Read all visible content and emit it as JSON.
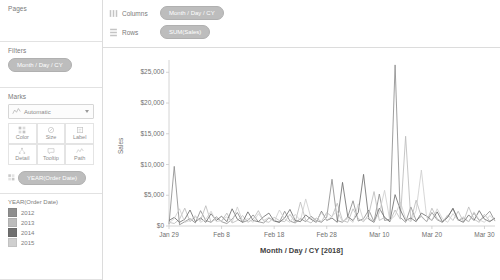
{
  "left_panel": {
    "pages": {
      "title": "Pages"
    },
    "filters": {
      "title": "Filters",
      "pills": [
        "Month / Day / CY"
      ]
    },
    "marks": {
      "title": "Marks",
      "mark_type": "Automatic",
      "buttons": [
        {
          "label": "Color",
          "icon": "color-icon"
        },
        {
          "label": "Size",
          "icon": "size-icon"
        },
        {
          "label": "Label",
          "icon": "label-icon"
        },
        {
          "label": "Detail",
          "icon": "detail-icon"
        },
        {
          "label": "Tooltip",
          "icon": "tooltip-icon"
        },
        {
          "label": "Path",
          "icon": "path-icon"
        }
      ],
      "encoding_pills": [
        {
          "label": "YEAR(Order Date)",
          "shelf": "Color"
        }
      ]
    },
    "legend": {
      "title": "YEAR(Order Date)",
      "items": [
        {
          "label": "2012",
          "color": "#8e8e8e"
        },
        {
          "label": "2013",
          "color": "#bcbcbc"
        },
        {
          "label": "2014",
          "color": "#6f6f6f"
        },
        {
          "label": "2015",
          "color": "#cfcfcf"
        }
      ]
    }
  },
  "shelves": {
    "columns": {
      "name": "Columns",
      "pills": [
        "Month / Day / CY"
      ]
    },
    "rows": {
      "name": "Rows",
      "pills": [
        "SUM(Sales)"
      ]
    }
  },
  "chart_data": {
    "type": "line",
    "title": "",
    "xlabel": "Month / Day / CY [2018]",
    "ylabel": "Sales",
    "ylim": [
      0,
      27000
    ],
    "ytick_labels": [
      "$0",
      "$5,000",
      "$10,000",
      "$15,000",
      "$20,000",
      "$25,000"
    ],
    "ytick_values": [
      0,
      5000,
      10000,
      15000,
      20000,
      25000
    ],
    "xtick_labels": [
      "Jan 29",
      "Feb 8",
      "Feb 18",
      "Feb 28",
      "Mar 10",
      "Mar 20",
      "Mar 30"
    ],
    "xtick_index": [
      0,
      10,
      20,
      30,
      40,
      50,
      60
    ],
    "x_count": 63,
    "grid": false,
    "legend_position": "left-panel",
    "series": [
      {
        "name": "2012",
        "color": "#8e8e8e",
        "values": [
          300,
          9700,
          200,
          700,
          1200,
          500,
          2500,
          900,
          600,
          1500,
          700,
          400,
          1100,
          2200,
          600,
          900,
          1800,
          700,
          500,
          1300,
          900,
          600,
          2400,
          800,
          500,
          1200,
          700,
          1600,
          900,
          600,
          1400,
          7600,
          900,
          600,
          1500,
          4100,
          800,
          1200,
          2600,
          700,
          5200,
          900,
          1100,
          26200,
          1400,
          600,
          3100,
          900,
          1600,
          700,
          2200,
          1000,
          600,
          1500,
          2800,
          900,
          1300,
          700,
          2100,
          900,
          1500,
          2400,
          800
        ]
      },
      {
        "name": "2013",
        "color": "#bcbcbc",
        "values": [
          600,
          400,
          1100,
          2900,
          700,
          1500,
          900,
          3300,
          600,
          1200,
          800,
          2100,
          500,
          900,
          1700,
          600,
          1100,
          2500,
          800,
          600,
          1400,
          900,
          700,
          1900,
          600,
          3900,
          900,
          500,
          1300,
          700,
          2200,
          1500,
          3700,
          900,
          600,
          2800,
          1200,
          700,
          1900,
          5600,
          900,
          1400,
          700,
          2600,
          1100,
          14600,
          900,
          4200,
          1500,
          700,
          2900,
          1200,
          600,
          1800,
          900,
          2400,
          700,
          3100,
          1100,
          600,
          1900,
          800,
          1200
        ]
      },
      {
        "name": "2014",
        "color": "#6f6f6f",
        "values": [
          900,
          1400,
          600,
          1100,
          2600,
          700,
          1300,
          600,
          2000,
          900,
          1600,
          700,
          2800,
          1100,
          600,
          2300,
          900,
          700,
          1500,
          2100,
          800,
          600,
          1300,
          2700,
          900,
          700,
          1800,
          1100,
          600,
          2400,
          900,
          1300,
          600,
          7100,
          1500,
          900,
          2200,
          8400,
          1100,
          600,
          2900,
          1400,
          700,
          5100,
          2600,
          900,
          1300,
          700,
          2100,
          1600,
          900,
          2300,
          700,
          1400,
          2900,
          1000,
          600,
          1800,
          900,
          2500,
          1100,
          700,
          1300
        ]
      },
      {
        "name": "2015",
        "color": "#cfcfcf",
        "values": [
          500,
          1200,
          2800,
          600,
          900,
          1700,
          600,
          1100,
          2400,
          700,
          900,
          1500,
          600,
          3100,
          800,
          1200,
          600,
          2000,
          900,
          1400,
          700,
          2600,
          1100,
          600,
          1900,
          900,
          4400,
          1300,
          700,
          2200,
          900,
          1600,
          2400,
          700,
          1200,
          600,
          3600,
          900,
          1400,
          700,
          2100,
          5800,
          900,
          1700,
          3900,
          1200,
          700,
          2500,
          9100,
          1400,
          900,
          2800,
          1200,
          600,
          2000,
          900,
          1500,
          700,
          2300,
          1000,
          600,
          1700,
          900
        ]
      }
    ]
  }
}
